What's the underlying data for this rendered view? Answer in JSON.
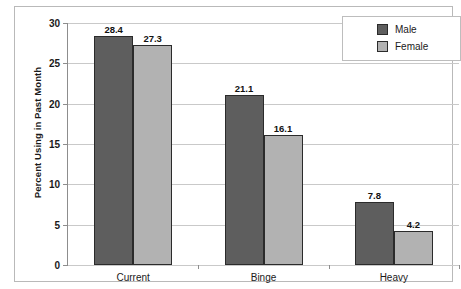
{
  "chart_data": {
    "type": "bar",
    "title": "",
    "xlabel": "",
    "ylabel": "Percent Using in Past Month",
    "ylim": [
      0,
      30
    ],
    "yticks": [
      0,
      5,
      10,
      15,
      20,
      25,
      30
    ],
    "ytick_labels": [
      "0",
      "5",
      "10",
      "15",
      "20",
      "25",
      "30"
    ],
    "grid": true,
    "legend_position": "top-right",
    "categories": [
      "Current",
      "Binge",
      "Heavy"
    ],
    "series": [
      {
        "name": "Male",
        "color": "#5e5e5e",
        "values": [
          28.4,
          21.1,
          7.8
        ],
        "labels": [
          "28.4",
          "21.1",
          "7.8"
        ]
      },
      {
        "name": "Female",
        "color": "#b2b2b2",
        "values": [
          27.3,
          16.1,
          4.2
        ],
        "labels": [
          "27.3",
          "16.1",
          "4.2"
        ]
      }
    ]
  },
  "legend": {
    "items": [
      {
        "label": "Male",
        "color": "#5e5e5e"
      },
      {
        "label": "Female",
        "color": "#b2b2b2"
      }
    ]
  }
}
